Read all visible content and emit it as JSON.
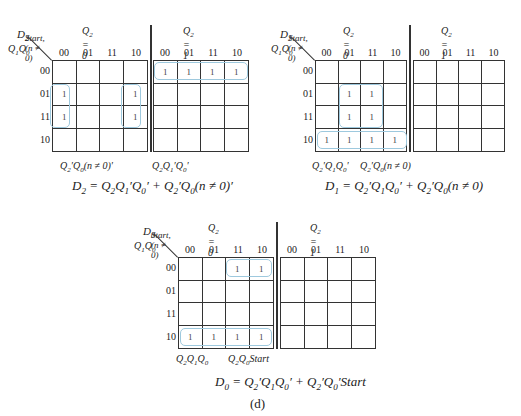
{
  "figure_label": "(d)",
  "col_codes": [
    "00",
    "01",
    "11",
    "10"
  ],
  "row_codes": [
    "00",
    "01",
    "11",
    "10"
  ],
  "maps": [
    {
      "name": "D2",
      "output_label": "D2",
      "input_label_top": "Start, (n ≠ 0)",
      "input_label_left": "Q1Q0",
      "half_labels": [
        "Q2 = 0",
        "Q2 = 1"
      ],
      "q2_0_ones": [
        [
          1,
          0
        ],
        [
          1,
          3
        ],
        [
          2,
          0
        ],
        [
          2,
          3
        ]
      ],
      "q2_1_ones": [
        [
          0,
          0
        ],
        [
          0,
          1
        ],
        [
          0,
          2
        ],
        [
          0,
          3
        ]
      ],
      "terms": [
        "Q′2Q0(n ≠ 0)′",
        "Q2Q′1Q′0"
      ],
      "equation": "D2 = Q2Q′1Q′0 + Q′2Q0(n ≠ 0)′"
    },
    {
      "name": "D1",
      "output_label": "D1",
      "input_label_top": "Start, (n ≠ 0)",
      "input_label_left": "Q1Q0",
      "half_labels": [
        "Q2 = 0",
        "Q2 = 1"
      ],
      "q2_0_ones": [
        [
          1,
          1
        ],
        [
          1,
          2
        ],
        [
          2,
          1
        ],
        [
          2,
          2
        ],
        [
          3,
          0
        ],
        [
          3,
          1
        ],
        [
          3,
          2
        ],
        [
          3,
          3
        ]
      ],
      "q2_1_ones": [],
      "terms": [
        "Q′2Q1Q′0",
        "Q′2Q0(n ≠ 0)"
      ],
      "equation": "D1 = Q′2Q1Q′0 + Q′2Q0(n ≠ 0)"
    },
    {
      "name": "D0",
      "output_label": "D0",
      "input_label_top": "Start, (n ≠ 0)",
      "input_label_left": "Q1Q0",
      "half_labels": [
        "Q2 = 0",
        "Q2 = 1"
      ],
      "q2_0_ones": [
        [
          0,
          2
        ],
        [
          0,
          3
        ],
        [
          3,
          0
        ],
        [
          3,
          1
        ],
        [
          3,
          2
        ],
        [
          3,
          3
        ]
      ],
      "q2_1_ones": [],
      "terms": [
        "Q2Q1Q0",
        "Q2Q0Start"
      ],
      "equation": "D0 = Q′2Q1Q′0 + Q′2Q′0Start"
    }
  ],
  "cell_value": "1",
  "colors": {
    "grid": "#333333",
    "loop": "#9ec9de",
    "pointer": "#3a8fd0"
  }
}
